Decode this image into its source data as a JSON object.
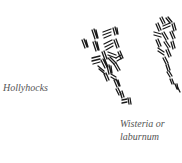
{
  "diagram": {
    "labels": {
      "hollyhocks": "Hollyhocks",
      "wisteria_line1": "Wisteria or",
      "wisteria_line2": "laburnum"
    },
    "colors": {
      "ink": "#1a1a1a",
      "label_text": "#555555",
      "background": "#ffffff"
    }
  }
}
